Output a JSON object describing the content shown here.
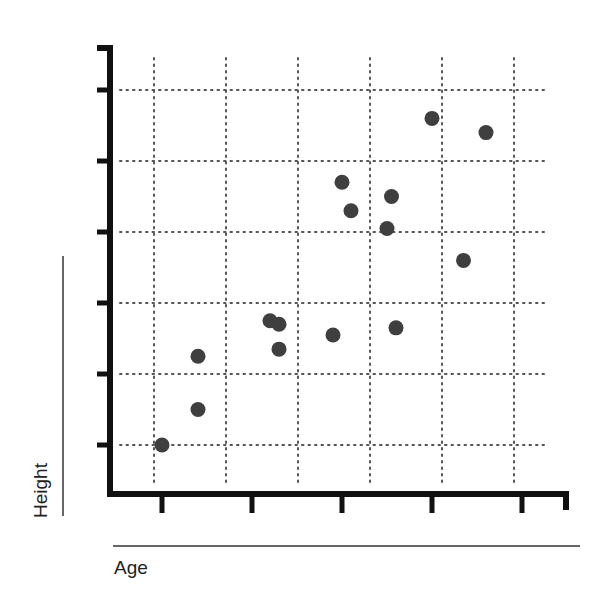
{
  "chart_data": {
    "type": "scatter",
    "title": "",
    "xlabel": "Age",
    "ylabel": "Height",
    "xlim": [
      0.5,
      5.5
    ],
    "ylim": [
      0,
      6.5
    ],
    "x_ticks": [
      1,
      2,
      3,
      4,
      5
    ],
    "y_ticks": [
      1,
      2,
      3,
      4,
      5,
      6
    ],
    "tick_labels_shown": false,
    "grid": true,
    "grid_style": "dotted",
    "legend": null,
    "marker_color": "#3f3f3f",
    "points": [
      {
        "x": 1.0,
        "y": 1.0
      },
      {
        "x": 1.4,
        "y": 1.5
      },
      {
        "x": 1.4,
        "y": 2.25
      },
      {
        "x": 2.2,
        "y": 2.75
      },
      {
        "x": 2.3,
        "y": 2.35
      },
      {
        "x": 2.3,
        "y": 2.7
      },
      {
        "x": 2.9,
        "y": 2.55
      },
      {
        "x": 3.0,
        "y": 4.7
      },
      {
        "x": 3.1,
        "y": 4.3
      },
      {
        "x": 3.5,
        "y": 4.05
      },
      {
        "x": 3.55,
        "y": 4.5
      },
      {
        "x": 3.6,
        "y": 2.65
      },
      {
        "x": 4.0,
        "y": 5.6
      },
      {
        "x": 4.35,
        "y": 3.6
      },
      {
        "x": 4.6,
        "y": 5.4
      }
    ]
  },
  "labels": {
    "x_axis": "Age",
    "y_axis": "Height"
  }
}
